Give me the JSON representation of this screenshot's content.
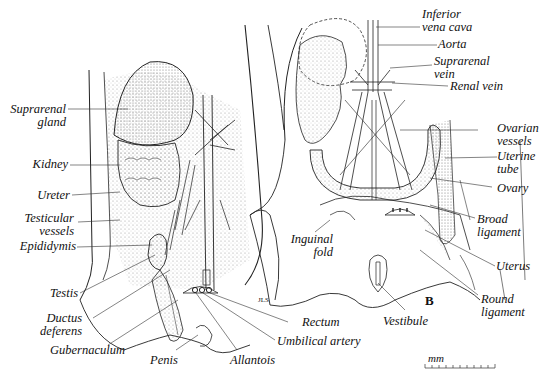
{
  "figure": {
    "panel_label": "B",
    "scale_unit": "mm",
    "signature": "JLS"
  },
  "left_panel": {
    "labels": [
      {
        "id": "suprarenal-gland",
        "l1": "Suprarenal",
        "l2": "gland"
      },
      {
        "id": "kidney",
        "l1": "Kidney"
      },
      {
        "id": "ureter",
        "l1": "Ureter"
      },
      {
        "id": "testicular-vessels",
        "l1": "Testicular",
        "l2": "vessels"
      },
      {
        "id": "epididymis",
        "l1": "Epididymis"
      },
      {
        "id": "testis",
        "l1": "Testis"
      },
      {
        "id": "ductus-deferens",
        "l1": "Ductus",
        "l2": "deferens"
      },
      {
        "id": "gubernaculum",
        "l1": "Gubernaculum"
      },
      {
        "id": "penis",
        "l1": "Penis"
      },
      {
        "id": "allantois",
        "l1": "Allantois"
      },
      {
        "id": "umbilical-artery",
        "l1": "Umbilical artery"
      },
      {
        "id": "rectum",
        "l1": "Rectum"
      }
    ]
  },
  "right_panel": {
    "labels": [
      {
        "id": "inferior-vena-cava",
        "l1": "Inferior",
        "l2": "vena cava"
      },
      {
        "id": "aorta",
        "l1": "Aorta"
      },
      {
        "id": "suprarenal-vein",
        "l1": "Suprarenal",
        "l2": "vein"
      },
      {
        "id": "renal-vein",
        "l1": "Renal vein"
      },
      {
        "id": "ovarian-vessels",
        "l1": "Ovarian",
        "l2": "vessels"
      },
      {
        "id": "uterine-tube",
        "l1": "Uterine",
        "l2": "tube"
      },
      {
        "id": "ovary",
        "l1": "Ovary"
      },
      {
        "id": "broad-ligament",
        "l1": "Broad",
        "l2": "ligament"
      },
      {
        "id": "uterus",
        "l1": "Uterus"
      },
      {
        "id": "round-ligament",
        "l1": "Round",
        "l2": "ligament"
      },
      {
        "id": "vestibule",
        "l1": "Vestibule"
      },
      {
        "id": "inguinal-fold",
        "l1": "Inguinal",
        "l2": "fold"
      }
    ]
  },
  "colors": {
    "ink": "#222222",
    "stipple": "#9a9a9a",
    "paper": "#ffffff"
  }
}
